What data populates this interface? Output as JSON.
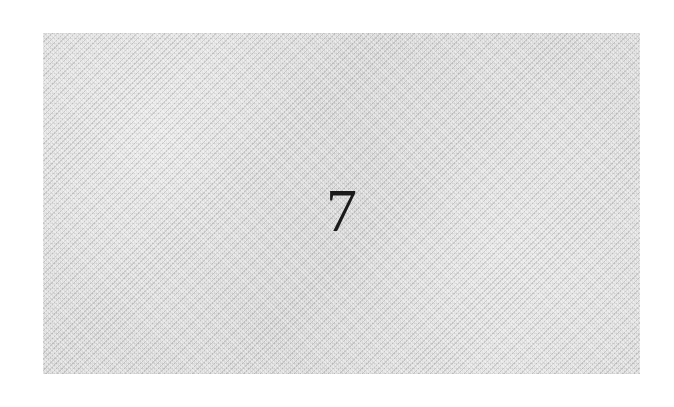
{
  "captcha": {
    "text": "7",
    "background_color": "#d9d9d9",
    "text_color": "#1a1a1a"
  }
}
